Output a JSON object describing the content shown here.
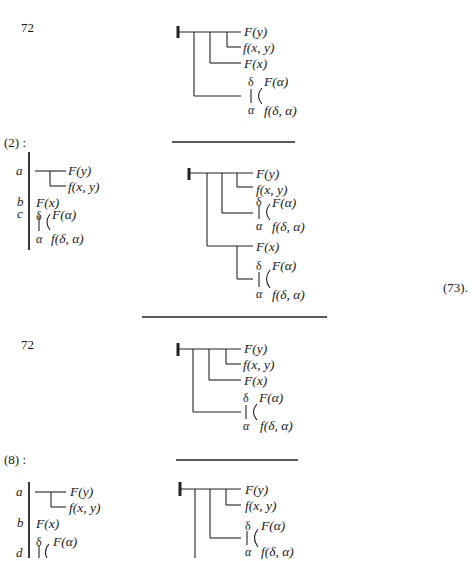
{
  "page": {
    "type": "Frege Begriffsschrift derivation page",
    "blocks": [
      {
        "id": "block1",
        "ref_label": "72",
        "formula": {
          "judgement": true,
          "consequent": "F(y)",
          "conditions": [
            "f(x, y)",
            "F(x)"
          ],
          "generality": {
            "upper": "δ",
            "lower": "α",
            "top": "F(α)",
            "bottom": "f(δ, α)"
          }
        },
        "labels": {
          "fy": "F(y)",
          "fxy": "f(x, y)",
          "fx": "F(x)",
          "delta": "δ",
          "alpha": "α",
          "falpha": "F(α)",
          "fdelta": "f(δ, α)"
        }
      },
      {
        "id": "block2",
        "ref_label": "(2) :",
        "premises": {
          "letters": [
            "a",
            "b",
            "c"
          ],
          "a": {
            "top": "F(y)",
            "bottom": "f(x, y)"
          },
          "b": "F(x)",
          "c": {
            "upper": "δ",
            "lower": "α",
            "top": "F(α)",
            "bottom": "f(δ, α)"
          }
        },
        "labels": {
          "fy": "F(y)",
          "fxy": "f(x, y)",
          "falpha1": "F(α)",
          "fdelta1": "f(δ, α)",
          "fx": "F(x)",
          "falpha2": "F(α)",
          "fdelta2": "f(δ, α)",
          "delta": "δ",
          "alpha": "α"
        },
        "equation_number": "(73)."
      },
      {
        "id": "block3",
        "ref_label": "72",
        "labels": {
          "fy": "F(y)",
          "fxy": "f(x, y)",
          "fx": "F(x)",
          "delta": "δ",
          "alpha": "α",
          "falpha": "F(α)",
          "fdelta": "f(δ, α)"
        }
      },
      {
        "id": "block4",
        "ref_label": "(8) :",
        "premises": {
          "letters": [
            "a",
            "b",
            "d"
          ],
          "a": {
            "top": "F(y)",
            "bottom": "f(x, y)"
          },
          "b": "F(x)",
          "d": {
            "upper": "δ",
            "top": "F(α)"
          }
        },
        "labels": {
          "fy": "F(y)",
          "fxy": "f(x, y)",
          "falpha": "F(α)",
          "fdelta": "f(δ, α)",
          "delta": "δ",
          "alpha": "α"
        }
      }
    ]
  }
}
